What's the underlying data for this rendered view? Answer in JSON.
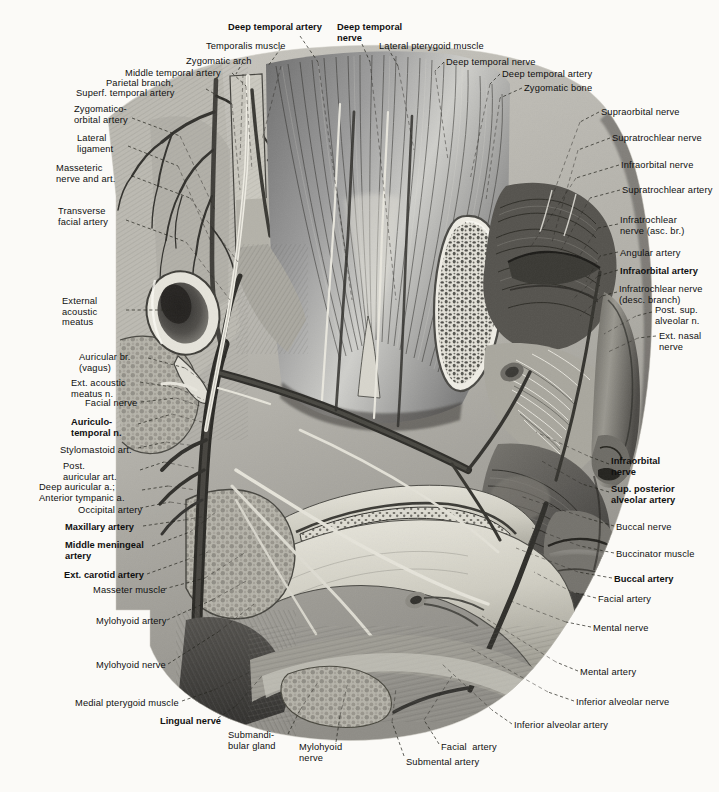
{
  "plate": {
    "title": "Lateral view of the face: infratemporal fossa, maxillary artery and trigeminal nerve branches",
    "background_color": "#fbfaf7",
    "ink_color": "#101010",
    "style": "grayscale halftone anatomical engraving"
  },
  "labels": [
    {
      "id": "deep-temporal-artery-top",
      "text": "Deep temporal artery",
      "bold": true,
      "x": 228,
      "y": 22,
      "align": "left",
      "leader": [
        [
          300,
          36
        ],
        [
          318,
          62
        ]
      ]
    },
    {
      "id": "deep-temporal-nerve-top",
      "text": "Deep temporal\nnerve",
      "bold": true,
      "x": 337,
      "y": 22,
      "align": "left",
      "leader": [
        [
          362,
          44
        ],
        [
          370,
          62
        ]
      ]
    },
    {
      "id": "temporalis-muscle",
      "text": "Temporalis muscle",
      "bold": false,
      "x": 206,
      "y": 41,
      "align": "left",
      "leader": [
        [
          281,
          48
        ],
        [
          268,
          66
        ]
      ]
    },
    {
      "id": "lateral-pterygoid-muscle",
      "text": "Lateral pterygoid muscle",
      "bold": false,
      "x": 379,
      "y": 41,
      "align": "left",
      "leader": [
        [
          388,
          48
        ],
        [
          398,
          66
        ]
      ]
    },
    {
      "id": "zygomatic-arch",
      "text": "Zygomatic arch",
      "bold": false,
      "x": 186,
      "y": 56,
      "align": "left",
      "leader": [
        [
          243,
          62
        ],
        [
          236,
          74
        ]
      ]
    },
    {
      "id": "deep-temporal-nerve-right",
      "text": "Deep temporal nerve",
      "bold": false,
      "x": 446,
      "y": 57,
      "align": "left",
      "leader": [
        [
          444,
          62
        ],
        [
          435,
          71
        ]
      ]
    },
    {
      "id": "middle-temporal-artery",
      "text": "Middle temporal artery",
      "bold": false,
      "x": 125,
      "y": 68,
      "align": "left",
      "leader": [
        [
          232,
          73
        ],
        [
          246,
          86
        ]
      ]
    },
    {
      "id": "deep-temporal-artery-right",
      "text": "Deep temporal artery",
      "bold": false,
      "x": 502,
      "y": 69,
      "align": "left",
      "leader": [
        [
          500,
          74
        ],
        [
          490,
          84
        ]
      ]
    },
    {
      "id": "parietal-branch",
      "text": "Parietal branch,",
      "bold": false,
      "x": 106,
      "y": 78,
      "align": "left",
      "leader": null
    },
    {
      "id": "superf-temporal-artery",
      "text": "Superf. temporal artery",
      "bold": false,
      "x": 76,
      "y": 88,
      "align": "left",
      "leader": [
        [
          206,
          89
        ],
        [
          232,
          104
        ]
      ]
    },
    {
      "id": "zygomatic-bone",
      "text": "Zygomatic bone",
      "bold": false,
      "x": 524,
      "y": 83,
      "align": "left",
      "leader": [
        [
          522,
          88
        ],
        [
          500,
          98
        ]
      ]
    },
    {
      "id": "zygomatico-orbital-artery",
      "text": "Zygomatico-\norbital artery",
      "bold": false,
      "x": 74,
      "y": 104,
      "align": "left",
      "leader": [
        [
          132,
          118
        ],
        [
          180,
          136
        ]
      ]
    },
    {
      "id": "supraorbital-nerve",
      "text": "Supraorbital nerve",
      "bold": false,
      "x": 601,
      "y": 107,
      "align": "left",
      "leader": [
        [
          599,
          112
        ],
        [
          580,
          122
        ]
      ]
    },
    {
      "id": "supratrochlear-nerve",
      "text": "Supratrochlear nerve",
      "bold": false,
      "x": 612,
      "y": 133,
      "align": "left",
      "leader": [
        [
          610,
          138
        ],
        [
          578,
          150
        ]
      ]
    },
    {
      "id": "lateral-ligament",
      "text": "Lateral\nligament",
      "bold": false,
      "x": 77,
      "y": 133,
      "align": "left",
      "leader": [
        [
          128,
          146
        ],
        [
          178,
          166
        ]
      ]
    },
    {
      "id": "infraorbital-nerve-right",
      "text": "Infraorbital nerve",
      "bold": false,
      "x": 621,
      "y": 160,
      "align": "left",
      "leader": [
        [
          619,
          165
        ],
        [
          576,
          178
        ]
      ]
    },
    {
      "id": "masseteric-nerve-and-art",
      "text": "Masseteric\nnerve and art.",
      "bold": false,
      "x": 56,
      "y": 163,
      "align": "left",
      "leader": [
        [
          132,
          176
        ],
        [
          190,
          198
        ]
      ]
    },
    {
      "id": "supratrochlear-artery",
      "text": "Supratrochlear artery",
      "bold": false,
      "x": 622,
      "y": 185,
      "align": "left",
      "leader": [
        [
          620,
          190
        ],
        [
          590,
          198
        ]
      ]
    },
    {
      "id": "transverse-facial-artery",
      "text": "Transverse\nfacial artery",
      "bold": false,
      "x": 58,
      "y": 206,
      "align": "left",
      "leader": [
        [
          126,
          220
        ],
        [
          186,
          242
        ]
      ]
    },
    {
      "id": "infratrochlear-nerve-asc",
      "text": "Infratrochlear\nnerve (asc. br.)",
      "bold": false,
      "x": 620,
      "y": 215,
      "align": "left",
      "leader": [
        [
          618,
          224
        ],
        [
          598,
          228
        ]
      ]
    },
    {
      "id": "angular-artery",
      "text": "Angular artery",
      "bold": false,
      "x": 620,
      "y": 248,
      "align": "left",
      "leader": [
        [
          618,
          252
        ],
        [
          600,
          256
        ]
      ]
    },
    {
      "id": "infraorbital-artery",
      "text": "Infraorbital artery",
      "bold": true,
      "x": 620,
      "y": 266,
      "align": "left",
      "leader": [
        [
          618,
          270
        ],
        [
          598,
          276
        ]
      ]
    },
    {
      "id": "external-acoustic-meatus",
      "text": "External\nacoustic\nmeatus",
      "bold": false,
      "x": 62,
      "y": 296,
      "align": "left",
      "leader": [
        [
          126,
          310
        ],
        [
          174,
          310
        ]
      ]
    },
    {
      "id": "infratrochlear-nerve-desc",
      "text": "Infratrochlear nerve\n(desc. branch)",
      "bold": false,
      "x": 619,
      "y": 284,
      "align": "left",
      "leader": [
        [
          617,
          292
        ],
        [
          602,
          296
        ]
      ]
    },
    {
      "id": "post-sup-alveolar-n",
      "text": "Post. sup.\nalveolar n.",
      "bold": false,
      "x": 655,
      "y": 305,
      "align": "left",
      "leader": [
        [
          652,
          312
        ],
        [
          636,
          316
        ]
      ]
    },
    {
      "id": "ext-nasal-nerve",
      "text": "Ext. nasal\nnerve",
      "bold": false,
      "x": 659,
      "y": 331,
      "align": "left",
      "leader": [
        [
          656,
          336
        ],
        [
          638,
          338
        ]
      ]
    },
    {
      "id": "auricular-br-vagus",
      "text": "Auricular br.\n(vagus)",
      "bold": false,
      "x": 79,
      "y": 352,
      "align": "left",
      "leader": [
        [
          148,
          358
        ],
        [
          185,
          368
        ]
      ]
    },
    {
      "id": "ext-acoustic-meatus-n",
      "text": "Ext. acoustic\nmeatus n.",
      "bold": false,
      "x": 71,
      "y": 378,
      "align": "left",
      "leader": [
        [
          140,
          382
        ],
        [
          178,
          388
        ]
      ]
    },
    {
      "id": "facial-nerve",
      "text": "Facial nerve",
      "bold": false,
      "x": 85,
      "y": 398,
      "align": "left",
      "leader": [
        [
          141,
          402
        ],
        [
          176,
          398
        ]
      ]
    },
    {
      "id": "auriculo-temporal-n",
      "text": "Auriculo-\ntemporal n.",
      "bold": true,
      "x": 71,
      "y": 417,
      "align": "left",
      "leader": [
        [
          138,
          424
        ],
        [
          172,
          414
        ]
      ]
    },
    {
      "id": "infraorbital-nerve-lower",
      "text": "Infraorbital\nnerve",
      "bold": true,
      "x": 611,
      "y": 456,
      "align": "left",
      "leader": [
        [
          609,
          464
        ],
        [
          588,
          456
        ]
      ]
    },
    {
      "id": "stylomastoid-art",
      "text": "Stylomastoid art.",
      "bold": false,
      "x": 60,
      "y": 445,
      "align": "left",
      "leader": [
        [
          138,
          448
        ],
        [
          166,
          442
        ]
      ]
    },
    {
      "id": "post-auricular-art",
      "text": "Post.\nauricular art.",
      "bold": false,
      "x": 63,
      "y": 461,
      "align": "left",
      "leader": [
        [
          140,
          470
        ],
        [
          164,
          462
        ]
      ]
    },
    {
      "id": "sup-posterior-alveolar-artery",
      "text": "Sup. posterior\nalveolar artery",
      "bold": true,
      "x": 611,
      "y": 484,
      "align": "left",
      "leader": [
        [
          609,
          492
        ],
        [
          582,
          484
        ]
      ]
    },
    {
      "id": "deep-auricular-a",
      "text": "Deep auricular a.;\nAnterior tympanic a.",
      "bold": false,
      "x": 39,
      "y": 482,
      "align": "left",
      "leader": [
        [
          142,
          490
        ],
        [
          168,
          486
        ]
      ]
    },
    {
      "id": "occipital-artery",
      "text": "Occipital artery",
      "bold": false,
      "x": 78,
      "y": 505,
      "align": "left",
      "leader": [
        [
          140,
          508
        ],
        [
          170,
          502
        ]
      ]
    },
    {
      "id": "buccal-nerve",
      "text": "Buccal nerve",
      "bold": false,
      "x": 616,
      "y": 522,
      "align": "left",
      "leader": [
        [
          614,
          526
        ],
        [
          586,
          518
        ]
      ]
    },
    {
      "id": "maxillary-artery",
      "text": "Maxillary artery",
      "bold": true,
      "x": 65,
      "y": 522,
      "align": "left",
      "leader": [
        [
          143,
          526
        ],
        [
          184,
          520
        ]
      ]
    },
    {
      "id": "middle-meningeal-artery",
      "text": "Middle meningeal\nartery",
      "bold": true,
      "x": 65,
      "y": 540,
      "align": "left",
      "leader": [
        [
          152,
          546
        ],
        [
          190,
          532
        ]
      ]
    },
    {
      "id": "buccinator-muscle",
      "text": "Buccinator muscle",
      "bold": false,
      "x": 616,
      "y": 549,
      "align": "left",
      "leader": [
        [
          614,
          553
        ],
        [
          580,
          546
        ]
      ]
    },
    {
      "id": "ext-carotid-artery",
      "text": "Ext. carotid artery",
      "bold": true,
      "x": 64,
      "y": 570,
      "align": "left",
      "leader": [
        [
          147,
          574
        ],
        [
          186,
          560
        ]
      ]
    },
    {
      "id": "buccal-artery",
      "text": "Buccal artery",
      "bold": true,
      "x": 614,
      "y": 574,
      "align": "left",
      "leader": [
        [
          612,
          578
        ],
        [
          578,
          572
        ]
      ]
    },
    {
      "id": "masseter-muscle",
      "text": "Masseter muscle",
      "bold": false,
      "x": 93,
      "y": 585,
      "align": "left",
      "leader": [
        [
          164,
          589
        ],
        [
          205,
          578
        ]
      ]
    },
    {
      "id": "facial-artery",
      "text": "Facial artery",
      "bold": false,
      "x": 598,
      "y": 594,
      "align": "left",
      "leader": [
        [
          596,
          598
        ],
        [
          572,
          592
        ]
      ]
    },
    {
      "id": "mylohyoid-artery",
      "text": "Mylohyoid artery",
      "bold": false,
      "x": 96,
      "y": 616,
      "align": "left",
      "leader": [
        [
          167,
          620
        ],
        [
          212,
          600
        ]
      ]
    },
    {
      "id": "mental-nerve",
      "text": "Mental nerve",
      "bold": false,
      "x": 593,
      "y": 623,
      "align": "left",
      "leader": [
        [
          591,
          627
        ],
        [
          566,
          622
        ]
      ]
    },
    {
      "id": "mylohyoid-nerve",
      "text": "Mylohyoid nerve",
      "bold": false,
      "x": 96,
      "y": 660,
      "align": "left",
      "leader": [
        [
          168,
          664
        ],
        [
          218,
          632
        ]
      ]
    },
    {
      "id": "mental-artery",
      "text": "Mental artery",
      "bold": false,
      "x": 580,
      "y": 667,
      "align": "left",
      "leader": [
        [
          578,
          671
        ],
        [
          556,
          662
        ]
      ]
    },
    {
      "id": "medial-pterygoid-muscle",
      "text": "Medial pterygoid muscle",
      "bold": false,
      "x": 75,
      "y": 698,
      "align": "left",
      "leader": [
        [
          182,
          701
        ],
        [
          214,
          690
        ]
      ]
    },
    {
      "id": "inferior-alveolar-nerve",
      "text": "Inferior alveolar nerve",
      "bold": false,
      "x": 576,
      "y": 697,
      "align": "left",
      "leader": [
        [
          574,
          701
        ],
        [
          548,
          692
        ]
      ]
    },
    {
      "id": "lingual-nerve",
      "text": "Lingual nerve",
      "bold": true,
      "x": 160,
      "y": 716,
      "align": "left",
      "leader": [
        [
          218,
          718
        ],
        [
          236,
          706
        ]
      ]
    },
    {
      "id": "inferior-alveolar-artery",
      "text": "Inferior alveolar artery",
      "bold": false,
      "x": 514,
      "y": 720,
      "align": "left",
      "leader": [
        [
          512,
          724
        ],
        [
          492,
          710
        ]
      ]
    },
    {
      "id": "submandibular-gland",
      "text": "Submandi-\nbular gland",
      "bold": false,
      "x": 228,
      "y": 730,
      "align": "left",
      "leader": [
        [
          288,
          734
        ],
        [
          300,
          710
        ]
      ]
    },
    {
      "id": "facial-artery-bottom",
      "text": "Facial  artery",
      "bold": false,
      "x": 441,
      "y": 742,
      "align": "left",
      "leader": [
        [
          439,
          744
        ],
        [
          424,
          720
        ]
      ]
    },
    {
      "id": "mylohyoid-nerve-bottom",
      "text": "Mylohyoid\nnerve",
      "bold": false,
      "x": 299,
      "y": 742,
      "align": "left",
      "leader": [
        [
          336,
          742
        ],
        [
          340,
          716
        ]
      ]
    },
    {
      "id": "submental-artery",
      "text": "Submental artery",
      "bold": false,
      "x": 406,
      "y": 757,
      "align": "left",
      "leader": [
        [
          404,
          756
        ],
        [
          392,
          722
        ]
      ]
    }
  ]
}
